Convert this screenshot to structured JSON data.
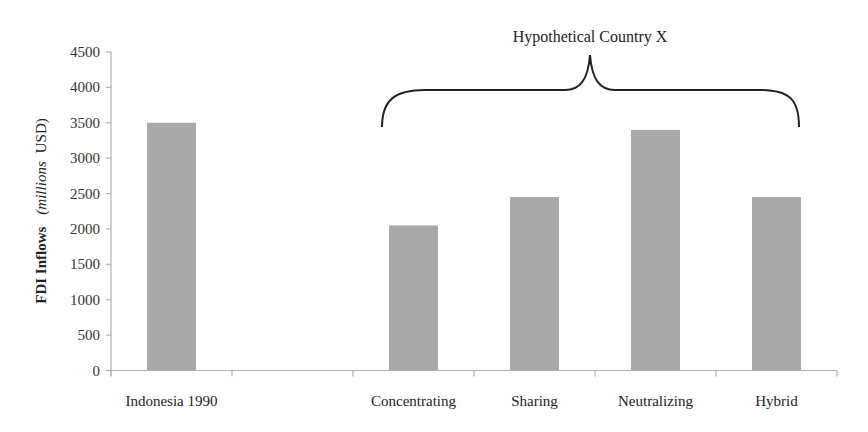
{
  "chart_data": {
    "type": "bar",
    "title": "",
    "xlabel": "",
    "ylabel": "FDI Inflows (millions USD)",
    "ylabel_parts": {
      "bold": "FDI Inflows",
      "italic": "millions",
      "rest": "USD"
    },
    "categories": [
      "Indonesia 1990",
      "",
      "Concentrating",
      "Sharing",
      "Neutralizing",
      "Hybrid"
    ],
    "values": [
      3500,
      null,
      2050,
      2450,
      3400,
      2450
    ],
    "ylim": [
      0,
      4500
    ],
    "yticks": [
      0,
      500,
      1000,
      1500,
      2000,
      2500,
      3000,
      3500,
      4000,
      4500
    ],
    "grid": false,
    "legend": null,
    "bar_color": "#a9a9a9",
    "annotations": [
      {
        "text": "Hypothetical Country X",
        "type": "brace",
        "spans": [
          "Concentrating",
          "Sharing",
          "Neutralizing",
          "Hybrid"
        ]
      }
    ]
  }
}
